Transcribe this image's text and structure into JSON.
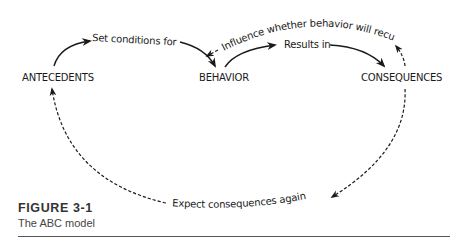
{
  "figure": {
    "nodes": {
      "antecedents": "ANTECEDENTS",
      "behavior": "BEHAVIOR",
      "consequences": "CONSEQUENCES"
    },
    "edges": {
      "set_conditions": "Set conditions for",
      "results_in": "Results in",
      "influence": "Influence whether behavior will recur",
      "expect_again": "Expect consequences again"
    },
    "edge_styles": {
      "set_conditions": "solid",
      "results_in": "solid",
      "influence": "dashed",
      "expect_again": "dashed"
    }
  },
  "caption": {
    "title": "FIGURE 3-1",
    "subtitle": "The ABC model"
  }
}
